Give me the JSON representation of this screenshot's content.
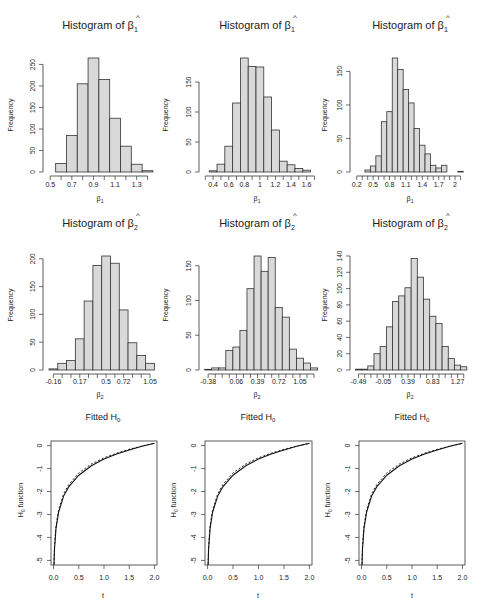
{
  "figure": {
    "bar_fill": "#d9d9d9",
    "bar_stroke": "#333333",
    "axis_color": "#333333"
  },
  "chart_data": [
    {
      "type": "bar",
      "panel": "row1-col1",
      "title": "Histogram of β̂1",
      "title_main": "Histogram of ",
      "title_symbol": "β",
      "title_sub": "1",
      "xlabel": "β̂1",
      "xlabel_symbol": "β",
      "xlabel_sub": "1",
      "ylabel": "Frequency",
      "bin_start": 0.55,
      "bin_width": 0.1,
      "values": [
        20,
        85,
        205,
        265,
        215,
        125,
        60,
        18,
        3
      ],
      "xlim": [
        0.47,
        1.46
      ],
      "ylim": [
        0,
        265
      ],
      "xticks": [
        0.5,
        0.6,
        0.7,
        0.8,
        0.9,
        1.0,
        1.1,
        1.2,
        1.3,
        1.4
      ],
      "xtick_labels": [
        {
          "v": 0.5,
          "t": "0.5"
        },
        {
          "v": 0.7,
          "t": "0.7"
        },
        {
          "v": 0.9,
          "t": "0.9"
        },
        {
          "v": 1.1,
          "t": "1.1"
        },
        {
          "v": 1.3,
          "t": "1.3"
        }
      ],
      "yticks": [
        0,
        50,
        100,
        150,
        200,
        250
      ],
      "grid": false
    },
    {
      "type": "bar",
      "panel": "row1-col2",
      "title": "Histogram of β̂1",
      "title_main": "Histogram of ",
      "title_symbol": "β",
      "title_sub": "1",
      "xlabel": "β̂1",
      "xlabel_symbol": "β",
      "xlabel_sub": "1",
      "ylabel": "Frequency",
      "bin_start": 0.35,
      "bin_width": 0.1,
      "values": [
        2,
        13,
        43,
        115,
        190,
        176,
        175,
        125,
        70,
        18,
        12,
        6,
        3
      ],
      "xlim": [
        0.27,
        1.72
      ],
      "ylim": [
        0,
        190
      ],
      "xticks": [
        0.3,
        0.4,
        0.5,
        0.6,
        0.7,
        0.8,
        0.9,
        1.0,
        1.1,
        1.2,
        1.3,
        1.4,
        1.5,
        1.6,
        1.7
      ],
      "xtick_labels": [
        {
          "v": 0.4,
          "t": "0.4"
        },
        {
          "v": 0.6,
          "t": "0.6"
        },
        {
          "v": 0.8,
          "t": "0.8"
        },
        {
          "v": 1.0,
          "t": "1"
        },
        {
          "v": 1.2,
          "t": "1.2"
        },
        {
          "v": 1.4,
          "t": "1.4"
        },
        {
          "v": 1.6,
          "t": "1.6"
        }
      ],
      "yticks": [
        0,
        50,
        100,
        150
      ],
      "grid": false
    },
    {
      "type": "bar",
      "panel": "row1-col3",
      "title": "Histogram of β̂1",
      "title_main": "Histogram of ",
      "title_symbol": "β",
      "title_sub": "1",
      "xlabel": "β̂1",
      "xlabel_symbol": "β",
      "xlabel_sub": "1",
      "ylabel": "Frequency",
      "bin_start": 0.25,
      "bin_width": 0.1,
      "values": [
        0,
        3,
        9,
        24,
        75,
        90,
        170,
        153,
        123,
        103,
        65,
        40,
        27,
        10,
        6,
        10,
        0,
        0,
        1
      ],
      "xlim": [
        0.15,
        2.2
      ],
      "ylim": [
        0,
        170
      ],
      "xticks": [
        0.2,
        0.3,
        0.4,
        0.5,
        0.6,
        0.7,
        0.8,
        0.9,
        1.0,
        1.1,
        1.2,
        1.3,
        1.4,
        1.5,
        1.6,
        1.7,
        1.8,
        1.9,
        2.0,
        2.1
      ],
      "xtick_labels": [
        {
          "v": 0.2,
          "t": "0.2"
        },
        {
          "v": 0.5,
          "t": "0.5"
        },
        {
          "v": 0.8,
          "t": "0.8"
        },
        {
          "v": 1.1,
          "t": "1.1"
        },
        {
          "v": 1.4,
          "t": "1.4"
        },
        {
          "v": 1.7,
          "t": "1.7"
        },
        {
          "v": 2.0,
          "t": "2"
        }
      ],
      "yticks": [
        0,
        50,
        100,
        150
      ],
      "grid": false
    },
    {
      "type": "bar",
      "panel": "row2-col1",
      "title": "Histogram of β̂2",
      "title_main": "Histogram of ",
      "title_symbol": "β",
      "title_sub": "2",
      "xlabel": "β̂2",
      "xlabel_symbol": "β",
      "xlabel_sub": "2",
      "ylabel": "Frequency",
      "bin_start": -0.215,
      "bin_width": 0.11,
      "values": [
        2,
        12,
        17,
        56,
        124,
        188,
        205,
        192,
        108,
        49,
        26,
        12
      ],
      "xlim": [
        -0.24,
        1.1
      ],
      "ylim": [
        0,
        205
      ],
      "xticks": [
        -0.16,
        -0.05,
        0.06,
        0.17,
        0.28,
        0.39,
        0.5,
        0.61,
        0.72,
        0.83,
        0.94,
        1.05
      ],
      "xtick_labels": [
        {
          "v": -0.16,
          "t": "-0.16"
        },
        {
          "v": 0.17,
          "t": "0.17"
        },
        {
          "v": 0.5,
          "t": "0.5"
        },
        {
          "v": 0.72,
          "t": "0.72"
        },
        {
          "v": 1.05,
          "t": "1.05"
        }
      ],
      "yticks": [
        0,
        50,
        100,
        150,
        200
      ],
      "grid": false
    },
    {
      "type": "bar",
      "panel": "row2-col2",
      "title": "Histogram of β̂2",
      "title_main": "Histogram of ",
      "title_symbol": "β",
      "title_sub": "2",
      "xlabel": "β̂2",
      "xlabel_symbol": "β",
      "xlabel_sub": "2",
      "ylabel": "Frequency",
      "bin_start": -0.435,
      "bin_width": 0.11,
      "values": [
        1,
        3,
        3,
        28,
        33,
        57,
        117,
        164,
        142,
        162,
        90,
        76,
        30,
        17,
        10,
        3
      ],
      "xlim": [
        -0.46,
        1.3
      ],
      "ylim": [
        0,
        164
      ],
      "xticks": [
        -0.38,
        -0.27,
        -0.16,
        -0.05,
        0.06,
        0.17,
        0.28,
        0.39,
        0.5,
        0.61,
        0.72,
        0.83,
        0.94,
        1.05,
        1.16,
        1.27
      ],
      "xtick_labels": [
        {
          "v": -0.38,
          "t": "-0.38"
        },
        {
          "v": 0.06,
          "t": "0.06"
        },
        {
          "v": 0.39,
          "t": "0.39"
        },
        {
          "v": 0.72,
          "t": "0.72"
        },
        {
          "v": 1.05,
          "t": "1.05"
        }
      ],
      "yticks": [
        0,
        50,
        100,
        150
      ],
      "grid": false
    },
    {
      "type": "bar",
      "panel": "row2-col3",
      "title": "Histogram of β̂2",
      "title_main": "Histogram of ",
      "title_symbol": "β",
      "title_sub": "2",
      "xlabel": "β̂2",
      "xlabel_symbol": "β",
      "xlabel_sub": "2",
      "ylabel": "Frequency",
      "bin_start": -0.545,
      "bin_width": 0.11,
      "values": [
        1,
        1,
        5,
        20,
        29,
        53,
        84,
        91,
        101,
        137,
        114,
        87,
        66,
        57,
        29,
        14,
        6,
        4
      ],
      "xlim": [
        -0.57,
        1.42
      ],
      "ylim": [
        0,
        140
      ],
      "xticks": [
        -0.49,
        -0.38,
        -0.27,
        -0.16,
        -0.05,
        0.06,
        0.17,
        0.28,
        0.39,
        0.5,
        0.61,
        0.72,
        0.83,
        0.94,
        1.05,
        1.16,
        1.27,
        1.38
      ],
      "xtick_labels": [
        {
          "v": -0.49,
          "t": "-0.49"
        },
        {
          "v": -0.05,
          "t": "-0.05"
        },
        {
          "v": 0.39,
          "t": "0.39"
        },
        {
          "v": 0.83,
          "t": "0.83"
        },
        {
          "v": 1.27,
          "t": "1.27"
        }
      ],
      "yticks": [
        0,
        20,
        40,
        60,
        80,
        100,
        120,
        140
      ],
      "grid": false
    },
    {
      "type": "line",
      "panel": "row3-col1",
      "title": "Fitted H0",
      "title_main": "Fitted H",
      "title_sub": "0",
      "xlabel": "t",
      "ylabel": "H0 function",
      "ylabel_main": "H",
      "ylabel_sub": "0",
      "ylabel_rest": " function",
      "xlim": [
        -0.05,
        2.05
      ],
      "ylim": [
        -5.2,
        0.2
      ],
      "xticks": [
        0.0,
        0.5,
        1.0,
        1.5,
        2.0
      ],
      "xtick_labels": [
        "0.0",
        "0.5",
        "1.0",
        "1.5",
        "2.0"
      ],
      "yticks": [
        0,
        -1,
        -2,
        -3,
        -4,
        -5
      ],
      "series": [
        {
          "name": "fitted",
          "style": "solid",
          "function": "log(t/2)+0.1",
          "x": [
            0.01,
            0.02,
            0.05,
            0.1,
            0.2,
            0.3,
            0.5,
            0.75,
            1.0,
            1.25,
            1.5,
            1.75,
            2.0
          ],
          "y": [
            -5.2,
            -4.5,
            -3.6,
            -2.9,
            -2.2,
            -1.8,
            -1.29,
            -0.88,
            -0.59,
            -0.37,
            -0.19,
            -0.03,
            0.1
          ]
        },
        {
          "name": "true",
          "style": "dashed",
          "function": "log(t/2)+0.15 (slightly above)",
          "x": [
            0.01,
            0.02,
            0.05,
            0.1,
            0.2,
            0.3,
            0.5,
            0.75,
            1.0,
            1.25,
            1.5,
            1.75,
            2.0
          ],
          "y": [
            -5.15,
            -4.4,
            -3.5,
            -2.8,
            -2.1,
            -1.7,
            -1.19,
            -0.8,
            -0.53,
            -0.33,
            -0.16,
            -0.02,
            0.1
          ]
        }
      ],
      "frame": "box"
    },
    {
      "type": "line",
      "panel": "row3-col2",
      "title": "Fitted H0",
      "title_main": "Fitted H",
      "title_sub": "0",
      "xlabel": "t",
      "ylabel": "H0 function",
      "ylabel_main": "H",
      "ylabel_sub": "0",
      "ylabel_rest": " function",
      "xlim": [
        -0.05,
        2.05
      ],
      "ylim": [
        -5.2,
        0.2
      ],
      "xticks": [
        0.0,
        0.5,
        1.0,
        1.5,
        2.0
      ],
      "xtick_labels": [
        "0.0",
        "0.5",
        "1.0",
        "1.5",
        "2.0"
      ],
      "yticks": [
        0,
        -1,
        -2,
        -3,
        -4,
        -5
      ],
      "series": [
        {
          "name": "fitted",
          "style": "solid",
          "x": [
            0.01,
            0.02,
            0.05,
            0.1,
            0.2,
            0.3,
            0.5,
            0.75,
            1.0,
            1.25,
            1.5,
            1.75,
            2.0
          ],
          "y": [
            -5.2,
            -4.5,
            -3.6,
            -2.9,
            -2.2,
            -1.8,
            -1.29,
            -0.88,
            -0.59,
            -0.37,
            -0.19,
            -0.03,
            0.1
          ]
        },
        {
          "name": "true",
          "style": "dashed",
          "x": [
            0.01,
            0.02,
            0.05,
            0.1,
            0.2,
            0.3,
            0.5,
            0.75,
            1.0,
            1.25,
            1.5,
            1.75,
            2.0
          ],
          "y": [
            -5.15,
            -4.4,
            -3.5,
            -2.8,
            -2.1,
            -1.7,
            -1.19,
            -0.8,
            -0.53,
            -0.33,
            -0.16,
            -0.02,
            0.1
          ]
        }
      ],
      "frame": "box"
    },
    {
      "type": "line",
      "panel": "row3-col3",
      "title": "Fitted H0",
      "title_main": "Fitted H",
      "title_sub": "0",
      "xlabel": "t",
      "ylabel": "H0 function",
      "ylabel_main": "H",
      "ylabel_sub": "0",
      "ylabel_rest": " function",
      "xlim": [
        -0.05,
        2.05
      ],
      "ylim": [
        -5.2,
        0.2
      ],
      "xticks": [
        0.0,
        0.5,
        1.0,
        1.5,
        2.0
      ],
      "xtick_labels": [
        "0.0",
        "0.5",
        "1.0",
        "1.5",
        "2.0"
      ],
      "yticks": [
        0,
        -1,
        -2,
        -3,
        -4,
        -5
      ],
      "series": [
        {
          "name": "fitted",
          "style": "solid",
          "x": [
            0.01,
            0.02,
            0.05,
            0.1,
            0.2,
            0.3,
            0.5,
            0.75,
            1.0,
            1.25,
            1.5,
            1.75,
            2.0
          ],
          "y": [
            -5.2,
            -4.5,
            -3.6,
            -2.9,
            -2.2,
            -1.8,
            -1.29,
            -0.88,
            -0.59,
            -0.37,
            -0.19,
            -0.03,
            0.1
          ]
        },
        {
          "name": "true",
          "style": "dashed",
          "x": [
            0.01,
            0.02,
            0.05,
            0.1,
            0.2,
            0.3,
            0.5,
            0.75,
            1.0,
            1.25,
            1.5,
            1.75,
            2.0
          ],
          "y": [
            -5.15,
            -4.4,
            -3.5,
            -2.8,
            -2.1,
            -1.7,
            -1.19,
            -0.8,
            -0.53,
            -0.33,
            -0.16,
            -0.02,
            0.1
          ]
        }
      ],
      "frame": "box"
    }
  ]
}
